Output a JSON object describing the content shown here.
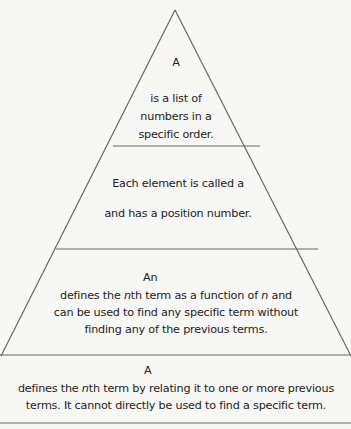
{
  "pyramid": {
    "line_color": "#666666",
    "text_color": "#222222",
    "background": "#f7f7f5",
    "tiers": [
      {
        "name": "sequence",
        "term_label": "A",
        "lines": [
          "is a list of",
          "numbers in a",
          "specific order."
        ]
      },
      {
        "name": "term",
        "lines": [
          "Each element is called a",
          "and has a position number."
        ]
      },
      {
        "name": "explicit-formula",
        "term_label": "An",
        "lines": [
          "defines the nth term as a function of n and",
          "can be used to find any specific term without",
          "finding any of the previous terms."
        ]
      },
      {
        "name": "recursive-formula",
        "term_label": "A",
        "lines": [
          "defines the nth term by relating it to one or more previous",
          "terms. It cannot directly be used to find a specific term."
        ]
      }
    ],
    "italic_parts": {
      "n": "n",
      "th_term": "th term",
      "defines_the": "defines the ",
      "as_function_of": " as a function of ",
      "and": " and",
      "by_relating": " by relating it to one or more previous"
    }
  }
}
